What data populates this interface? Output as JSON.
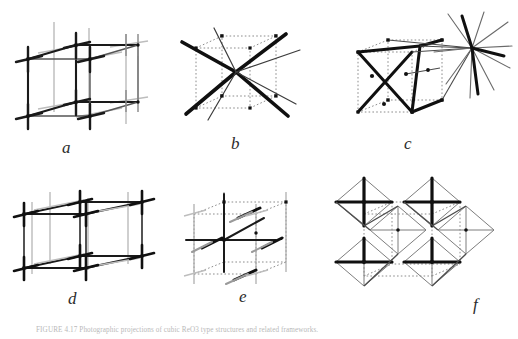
{
  "figure": {
    "background_color": "#ffffff",
    "ink_color": "#1a1a1a",
    "mid_ink_color": "#4d4d4d",
    "light_ink_color": "#9a9a9a",
    "dotted_color": "#8c8c8c",
    "caption_color": "#b9b9b9",
    "width": 518,
    "height": 339
  },
  "caption": {
    "label": "FIGURE 4.17",
    "text": "FIGURE 4.17   Photographic projections of cubic ReO3 type structures and related frameworks."
  },
  "panels": [
    {
      "id": "a",
      "label": "a",
      "name": "panel-a-cubic-corner-sharing-framework",
      "description": "Cubic framework with crossed-bar vertices showing corner-sharing octahedra axes",
      "style": "solid-cube-with-cross-vertices",
      "label_x": 62,
      "label_y": 139
    },
    {
      "id": "b",
      "label": "b",
      "name": "panel-b-body-centred-eight-coordination",
      "description": "Dotted cube with eight thick rods radiating from the body centre to the corners",
      "style": "dotted-cube-with-central-star",
      "label_x": 231,
      "label_y": 135
    },
    {
      "id": "c",
      "label": "c",
      "name": "panel-c-tetrahedral-net-with-external-cluster",
      "description": "Dotted cube containing bold tetrahedral linkage with a radiating cluster outside the upper right corner",
      "style": "dotted-cube-with-tetrahedron-and-star",
      "label_x": 404,
      "label_y": 135
    },
    {
      "id": "d",
      "label": "d",
      "name": "panel-d-layered-tetragonal-framework",
      "description": "Two stacked square layers of crossed-bar vertices forming a layered tetragonal framework",
      "style": "layered-slab-with-cross-vertices",
      "label_x": 68,
      "label_y": 290
    },
    {
      "id": "e",
      "label": "e",
      "name": "panel-e-dotted-cell-with-solid-axes",
      "description": "Dotted unit cell with solid axial framework and short dark bond bars at the nodes",
      "style": "dotted-cell-with-solid-axes",
      "label_x": 239,
      "label_y": 288
    },
    {
      "id": "f",
      "label": "f",
      "name": "panel-f-corner-sharing-octahedra-network",
      "description": "Network of corner-sharing octahedra outlining the unit cell in dotted lines",
      "style": "octahedra-network",
      "label_x": 473,
      "label_y": 296
    }
  ]
}
